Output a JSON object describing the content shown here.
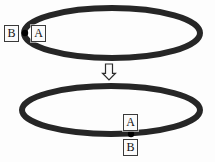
{
  "figure": {
    "background_color": "#fdfdfd",
    "stroke_color": "#262626",
    "point_color": "#000000",
    "width": 215,
    "height": 162
  },
  "top_loop": {
    "name": "upper-ellipse",
    "center_x": 112,
    "center_y": 33,
    "radius_x": 88,
    "radius_y": 25,
    "stroke_width": 6,
    "marked_point": {
      "x": 25,
      "y": 33,
      "radius": 3.2
    },
    "labels": [
      {
        "text": "B",
        "x": 4,
        "y": 25,
        "position": "outside-left"
      },
      {
        "text": "A",
        "x": 31,
        "y": 25,
        "position": "inside-right"
      }
    ]
  },
  "arrow": {
    "name": "down-arrow",
    "direction": "down",
    "x": 109,
    "y_top": 64,
    "y_bottom": 80,
    "shaft_width": 7,
    "head_width": 13,
    "stroke_color": "#2c2c2c",
    "fill_color": "#fafafa"
  },
  "bottom_loop": {
    "name": "lower-ellipse",
    "center_x": 111,
    "center_y": 110,
    "radius_x": 89,
    "radius_y": 24,
    "stroke_width": 6,
    "marked_point": {
      "x": 131,
      "y": 134,
      "radius": 3.2
    },
    "labels": [
      {
        "text": "A",
        "x": 123,
        "y": 114,
        "position": "inside-above"
      },
      {
        "text": "B",
        "x": 123,
        "y": 139,
        "position": "outside-below"
      }
    ]
  }
}
